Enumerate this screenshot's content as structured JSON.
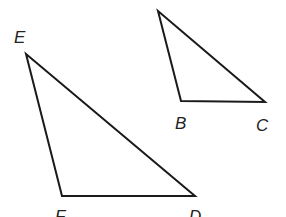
{
  "diagram": {
    "type": "geometry",
    "colors": {
      "stroke": "#1a1a1a",
      "label": "#222222",
      "background": "#ffffff"
    },
    "triangles": [
      {
        "name": "small-triangle",
        "vertices": [
          {
            "label": "",
            "x": 158,
            "y": 11
          },
          {
            "label": "B",
            "x": 181,
            "y": 101
          },
          {
            "label": "C",
            "x": 265,
            "y": 102
          }
        ]
      },
      {
        "name": "large-triangle",
        "vertices": [
          {
            "label": "E",
            "x": 26,
            "y": 54
          },
          {
            "label": "F",
            "x": 62,
            "y": 196
          },
          {
            "label": "D",
            "x": 195,
            "y": 196
          }
        ]
      }
    ],
    "labels": {
      "E": {
        "text": "E",
        "x": 14,
        "y": 43
      },
      "B": {
        "text": "B",
        "x": 175,
        "y": 129
      },
      "C": {
        "text": "C",
        "x": 256,
        "y": 131
      },
      "F": {
        "text": "F",
        "x": 55,
        "y": 222
      },
      "D": {
        "text": "D",
        "x": 189,
        "y": 222
      }
    }
  }
}
